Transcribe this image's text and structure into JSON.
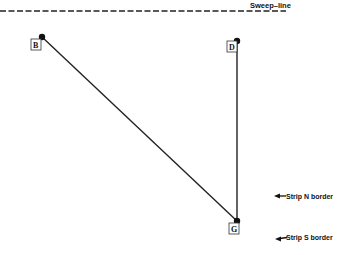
{
  "diagram": {
    "sweep_line": {
      "label": "Sweep–line",
      "y": 11,
      "x_start": 0,
      "x_end": 286,
      "style": "dashed"
    },
    "points": [
      {
        "id": "B",
        "label": "B",
        "x": 42,
        "y": 37
      },
      {
        "id": "D",
        "label": "D",
        "x": 237,
        "y": 41
      },
      {
        "id": "G",
        "label": "G",
        "x": 237,
        "y": 221
      }
    ],
    "edges": [
      {
        "from": "B",
        "to": "G"
      },
      {
        "from": "D",
        "to": "G"
      }
    ],
    "annotations": [
      {
        "id": "strip-n",
        "label": "Strip N border",
        "arrow_x": 274,
        "y": 196
      },
      {
        "id": "strip-s",
        "label": "Strip S border",
        "arrow_x": 275,
        "y": 238
      }
    ],
    "colors": {
      "ink": "#111111",
      "background": "#ffffff"
    }
  }
}
